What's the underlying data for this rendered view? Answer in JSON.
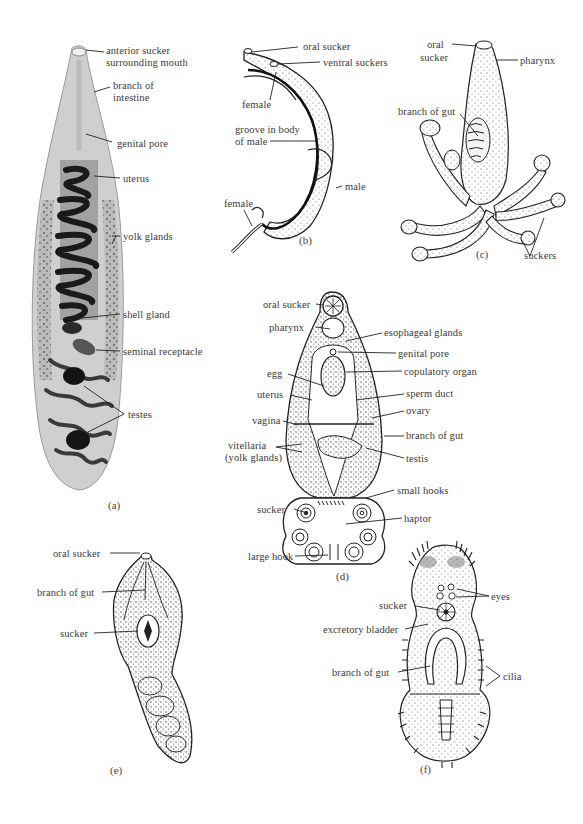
{
  "figure": {
    "panels": [
      {
        "id": "a",
        "caption": "(a)",
        "labels": {
          "anterior_sucker_1": "anterior sucker",
          "anterior_sucker_2": "surrounding mouth",
          "branch_of_intestine_1": "branch of",
          "branch_of_intestine_2": "intestine",
          "genital_pore": "genital pore",
          "uterus": "uterus",
          "yolk_glands": "yolk glands",
          "shell_gland": "shell gland",
          "seminal_receptacle": "seminal receptacle",
          "testes": "testes"
        }
      },
      {
        "id": "b",
        "caption": "(b)",
        "labels": {
          "oral_sucker": "oral sucker",
          "ventral_suckers": "ventral suckers",
          "female_top": "female",
          "groove_1": "groove in body",
          "groove_2": "of male",
          "male": "male",
          "female_bottom": "female"
        }
      },
      {
        "id": "c",
        "caption": "(c)",
        "labels": {
          "oral_sucker_1": "oral",
          "oral_sucker_2": "sucker",
          "pharynx": "pharynx",
          "branch_of_gut": "branch of gut",
          "suckers": "suckers"
        }
      },
      {
        "id": "d",
        "caption": "(d)",
        "labels": {
          "oral_sucker": "oral sucker",
          "pharynx": "pharynx",
          "esophageal_glands": "esophageal glands",
          "genital_pore": "genital pore",
          "egg": "egg",
          "copulatory_organ": "copulatory organ",
          "uterus": "uterus",
          "sperm_duct": "sperm duct",
          "vagina": "vagina",
          "ovary": "ovary",
          "branch_of_gut": "branch of gut",
          "vitellaria_1": "vitellaria",
          "vitellaria_2": "(yolk glands)",
          "testis": "testis",
          "small_hooks": "small hooks",
          "sucker": "sucker",
          "haptor": "haptor",
          "large_hook": "large hook"
        }
      },
      {
        "id": "e",
        "caption": "(e)",
        "labels": {
          "oral_sucker": "oral sucker",
          "branch_of_gut": "branch of gut",
          "sucker": "sucker"
        }
      },
      {
        "id": "f",
        "caption": "(f)",
        "labels": {
          "eyes": "eyes",
          "sucker": "sucker",
          "excretory_bladder": "excretory bladder",
          "branch_of_gut": "branch of gut",
          "cilia": "cilia"
        }
      }
    ]
  }
}
